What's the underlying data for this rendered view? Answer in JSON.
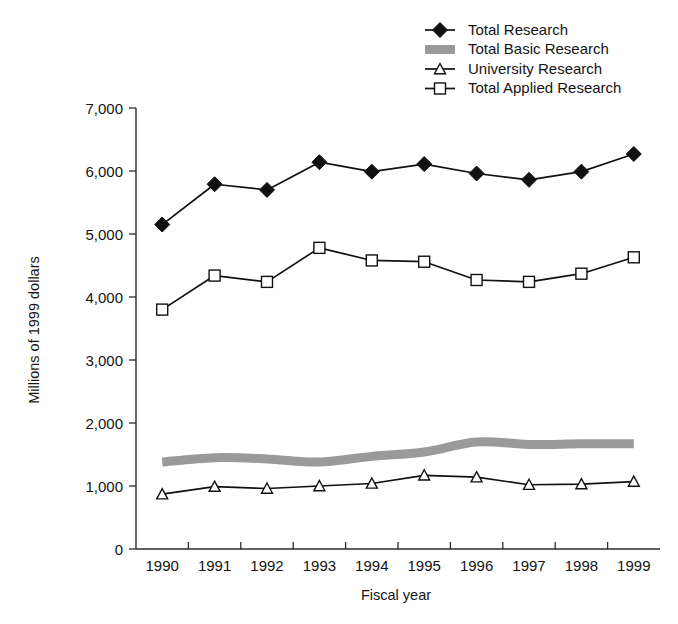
{
  "chart_data": {
    "type": "line",
    "title": "",
    "xlabel": "Fiscal year",
    "ylabel": "Millions of 1999 dollars",
    "categories": [
      "1990",
      "1991",
      "1992",
      "1993",
      "1994",
      "1995",
      "1996",
      "1997",
      "1998",
      "1999"
    ],
    "x": [
      1990,
      1991,
      1992,
      1993,
      1994,
      1995,
      1996,
      1997,
      1998,
      1999
    ],
    "ylim": [
      0,
      7000
    ],
    "xlim": [
      1990,
      1999
    ],
    "yticks": [
      0,
      1000,
      2000,
      3000,
      4000,
      5000,
      6000,
      7000
    ],
    "ytick_labels": [
      "0",
      "1,000",
      "2,000",
      "3,000",
      "4,000",
      "5,000",
      "6,000",
      "7,000"
    ],
    "grid": false,
    "legend_position": "top-right",
    "series": [
      {
        "name": "Total Research",
        "marker": "diamond-filled",
        "values": [
          5150,
          5790,
          5700,
          6140,
          5990,
          6110,
          5960,
          5860,
          5990,
          6270
        ]
      },
      {
        "name": "Total Basic Research",
        "marker": "band",
        "values": [
          1380,
          1450,
          1430,
          1380,
          1470,
          1540,
          1700,
          1660,
          1670,
          1670
        ]
      },
      {
        "name": "University Research",
        "marker": "triangle-open",
        "values": [
          870,
          990,
          960,
          1000,
          1040,
          1170,
          1140,
          1020,
          1030,
          1070
        ]
      },
      {
        "name": "Total Applied Research",
        "marker": "square-open",
        "values": [
          3800,
          4340,
          4240,
          4780,
          4580,
          4560,
          4270,
          4240,
          4370,
          4630
        ]
      }
    ]
  },
  "legend": {
    "items": [
      {
        "label": "Total Research",
        "marker": "diamond-filled"
      },
      {
        "label": "Total Basic Research",
        "marker": "band"
      },
      {
        "label": "University Research",
        "marker": "triangle-open"
      },
      {
        "label": "Total Applied Research",
        "marker": "square-open"
      }
    ]
  },
  "colors": {
    "ink": "#111111",
    "band_gray": "#9a9a9a",
    "background": "#ffffff"
  }
}
